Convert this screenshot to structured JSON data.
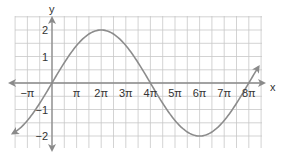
{
  "chart_data": {
    "type": "line",
    "title": "",
    "function": "y = 2 sin(x/4)",
    "xlabel": "x",
    "ylabel": "y",
    "x_tick_labels": [
      "−π",
      "π",
      "2π",
      "3π",
      "4π",
      "5π",
      "6π",
      "7π",
      "8π"
    ],
    "x_tick_values_in_pi": [
      -1,
      1,
      2,
      3,
      4,
      5,
      6,
      7,
      8
    ],
    "y_tick_labels": [
      "2",
      "1",
      "−1",
      "−2"
    ],
    "y_tick_values": [
      2,
      1,
      -1,
      -2
    ],
    "xlim_in_pi": [
      -1.5,
      8.5
    ],
    "ylim": [
      -2.5,
      2.5
    ],
    "grid": true,
    "legend": null,
    "series": [
      {
        "name": "2 sin(x/4)",
        "x_in_pi": [
          -1.6,
          -1,
          0,
          1,
          2,
          3,
          4,
          5,
          6,
          7,
          8,
          8.4
        ],
        "values": [
          -1.17,
          -0.77,
          0,
          1.41,
          2,
          1.41,
          0,
          -1.41,
          -2,
          -1.41,
          0,
          0.31
        ],
        "arrows": "both-ends"
      }
    ],
    "key_points": [
      {
        "x": "0",
        "y": 0
      },
      {
        "x": "2π",
        "y": 2,
        "note": "maximum"
      },
      {
        "x": "4π",
        "y": 0
      },
      {
        "x": "6π",
        "y": -2,
        "note": "minimum"
      },
      {
        "x": "8π",
        "y": 0
      }
    ]
  },
  "colors": {
    "grid": "#c8c8c8",
    "axis": "#8a8a8a",
    "curve": "#8c8c8c",
    "text": "#333333"
  }
}
